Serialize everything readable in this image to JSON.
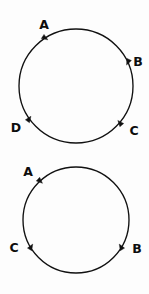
{
  "figure": {
    "background_color": "#fdfdfd",
    "stroke_color": "#111111",
    "label_color": "#0d0d0d",
    "width": 149,
    "height": 294
  },
  "chart_data": {
    "type": "diagram",
    "title": "",
    "xlabel": "",
    "ylabel": "",
    "grid": false,
    "legend": null,
    "shapes": [
      {
        "name": "top-circle",
        "kind": "circle",
        "center_x": 76,
        "center_y": 86,
        "radius": 57,
        "direction": "clockwise",
        "points": [
          {
            "label": "A",
            "angle_deg": 123,
            "x": 45,
            "y": 38,
            "label_x": 44,
            "label_y": 25,
            "arrow_deg": 33
          },
          {
            "label": "B",
            "angle_deg": 25,
            "x": 128,
            "y": 62,
            "label_x": 138,
            "label_y": 62,
            "arrow_deg": 115
          },
          {
            "label": "C",
            "angle_deg": -40,
            "x": 120,
            "y": 123,
            "label_x": 134,
            "label_y": 131,
            "arrow_deg": 230
          },
          {
            "label": "D",
            "angle_deg": 215,
            "x": 29,
            "y": 119,
            "label_x": 16,
            "label_y": 128,
            "arrow_deg": 305
          }
        ]
      },
      {
        "name": "bottom-circle",
        "kind": "circle",
        "center_x": 76,
        "center_y": 220,
        "radius": 53,
        "direction": "clockwise",
        "points": [
          {
            "label": "A",
            "angle_deg": 133,
            "x": 40,
            "y": 181,
            "label_x": 28,
            "label_y": 172,
            "arrow_deg": 43
          },
          {
            "label": "B",
            "angle_deg": -31,
            "x": 121,
            "y": 247,
            "label_x": 137,
            "label_y": 249,
            "arrow_deg": 239
          },
          {
            "label": "C",
            "angle_deg": 211,
            "x": 31,
            "y": 247,
            "label_x": 14,
            "label_y": 248,
            "arrow_deg": 301
          }
        ]
      }
    ]
  },
  "labels": {
    "top": {
      "a": "A",
      "b": "B",
      "c": "C",
      "d": "D"
    },
    "bottom": {
      "a": "A",
      "b": "B",
      "c": "C"
    }
  }
}
